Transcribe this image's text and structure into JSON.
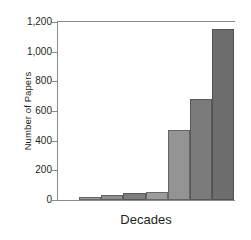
{
  "chart_data": {
    "type": "bar",
    "title": "",
    "xlabel": "Decades",
    "ylabel": "Number of Papers",
    "categories": [
      "1",
      "2",
      "3",
      "4",
      "5",
      "6",
      "7"
    ],
    "values": [
      20,
      35,
      48,
      55,
      475,
      680,
      1150
    ],
    "ylim": [
      0,
      1200
    ],
    "y_ticks": [
      0,
      200,
      400,
      600,
      800,
      1000,
      1200
    ],
    "y_tick_labels": [
      "0",
      "200",
      "400",
      "600",
      "800",
      "1,000",
      "1,200"
    ],
    "grid": false,
    "legend": "none",
    "bar_colors": [
      "#9a9a9a",
      "#8e8e8e",
      "#7d7d7d",
      "#9c9c9c",
      "#949494",
      "#7b7b7b",
      "#6d6d6d"
    ],
    "axis_color": "#8a8a8a",
    "text_color": "#231f20"
  }
}
